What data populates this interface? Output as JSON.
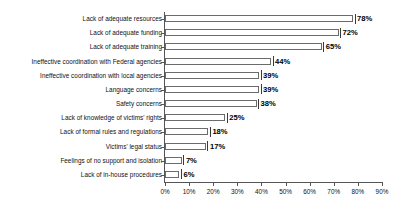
{
  "chart_data": {
    "type": "bar",
    "orientation": "horizontal",
    "title": "",
    "subtitle": "",
    "xlabel": "",
    "ylabel": "",
    "xlim": [
      0,
      90
    ],
    "grid": false,
    "legend": null,
    "value_suffix": "%",
    "xticks": [
      "0%",
      "10%",
      "20%",
      "30%",
      "40%",
      "50%",
      "60%",
      "70%",
      "80%",
      "90%"
    ],
    "xtick_values": [
      0,
      10,
      20,
      30,
      40,
      50,
      60,
      70,
      80,
      90
    ],
    "categories": [
      "Lack of adequate resources",
      "Lack of adequate funding",
      "Lack of adequate training",
      "Ineffective coordination with Federal agencies",
      "Ineffective coordination with local agencies",
      "Language concerns",
      "Safety concerns",
      "Lack of knowledge of victims' rights",
      "Lack of formal rules and regulations",
      "Victims' legal status",
      "Feelings of no support and isolation",
      "Lack of in-house procedures"
    ],
    "values": [
      78,
      72,
      65,
      44,
      39,
      39,
      38,
      25,
      18,
      17,
      7,
      6
    ],
    "data_labels": [
      "78%",
      "72%",
      "65%",
      "44%",
      "39%",
      "39%",
      "38%",
      "25%",
      "18%",
      "17%",
      "7%",
      "6%"
    ],
    "colors": {
      "bar_fill": "#ffffff",
      "bar_border": "#6b6b6b",
      "axis": "#555555",
      "text": "#111111",
      "background": "#ffffff"
    }
  }
}
